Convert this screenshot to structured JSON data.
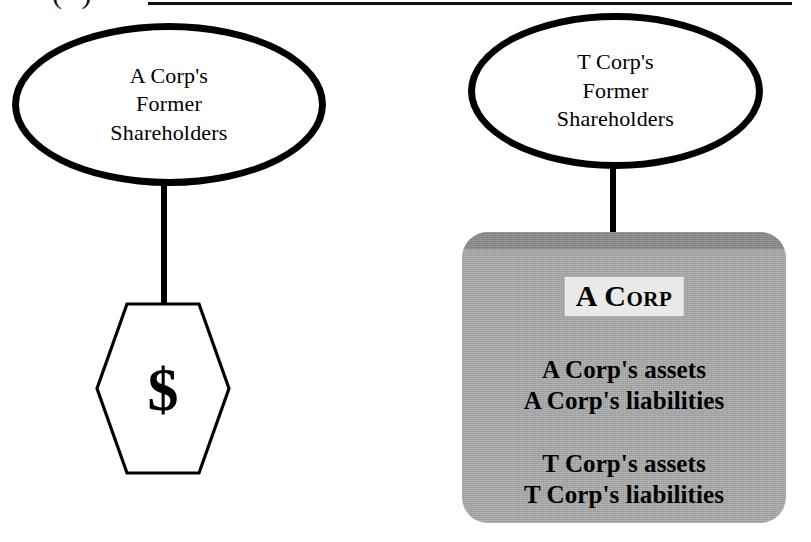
{
  "caption": {
    "paren_label": "( )",
    "rule": "horizontal-rule"
  },
  "nodes": {
    "ellipse_a": {
      "line1": "A Corp's",
      "line2": "Former",
      "line3": "Shareholders"
    },
    "ellipse_t": {
      "line1": "T Corp's",
      "line2": "Former",
      "line3": "Shareholders"
    },
    "hexagon": {
      "symbol": "$"
    },
    "gray_box": {
      "title": "A Corp",
      "group_a": {
        "line1": "A Corp's assets",
        "line2": "A Corp's liabilities"
      },
      "group_t": {
        "line1": "T Corp's assets",
        "line2": "T Corp's liabilities"
      }
    }
  },
  "colors": {
    "stroke": "#000000",
    "box_fill": "#a9a9a9",
    "box_bevel": "#8b8b8b",
    "title_highlight": "#e9e9e9",
    "background": "#ffffff"
  }
}
